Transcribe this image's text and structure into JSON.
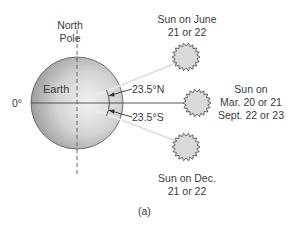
{
  "labels": {
    "north_pole_line1": "North",
    "north_pole_line2": "Pole",
    "earth": "Earth",
    "zero_degrees": "0°",
    "north_angle": "23.5°N",
    "south_angle": "23.5°S",
    "sun_june_line1": "Sun on June",
    "sun_june_line2": "21 or 22",
    "sun_equinox_line1": "Sun on",
    "sun_equinox_line2": "Mar. 20 or 21",
    "sun_equinox_line3": "Sept. 22 or 23",
    "sun_dec_line1": "Sun on Dec.",
    "sun_dec_line2": "21 or 22",
    "caption": "(a)"
  },
  "colors": {
    "earth_fill_light": "#f0f0f0",
    "earth_fill_dark": "#a8a8a8",
    "sun_fill": "#d9d9d9",
    "line": "#333333",
    "ray": "#d8d8d8"
  }
}
